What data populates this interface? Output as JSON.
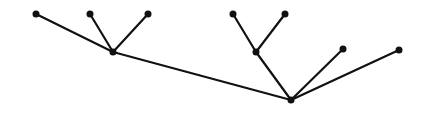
{
  "diagram": {
    "ink_color": "#111111",
    "background_color": "#ffffff",
    "width": 436,
    "height": 122,
    "nodes": [
      {
        "id": "n32",
        "left_label": "a",
        "right_label": "32",
        "x": 36,
        "y": 14
      },
      {
        "id": "n31",
        "left_label": "b",
        "right_label": "31",
        "x": 90,
        "y": 14
      },
      {
        "id": "n3s",
        "left_label": "c",
        "right_label": "3*",
        "x": 148,
        "y": 14
      },
      {
        "id": "n3",
        "left_label": "a→b→c",
        "right_label": "3",
        "x": 113,
        "y": 52
      },
      {
        "id": "n21",
        "left_label": "a",
        "right_label": "21",
        "x": 233,
        "y": 14
      },
      {
        "id": "n2s",
        "left_label": "b",
        "right_label": "2*",
        "x": 285,
        "y": 14
      },
      {
        "id": "n2",
        "left_label": "a→b",
        "right_label": "2",
        "x": 256,
        "y": 52
      },
      {
        "id": "n1",
        "left_label": "a",
        "right_label": "1",
        "x": 343,
        "y": 49
      },
      {
        "id": "nstar",
        "left_label": "c",
        "right_label": "*",
        "x": 399,
        "y": 50
      },
      {
        "id": "root",
        "left_label": "(a→b→c)→ (a→b)→ a→ c",
        "right_label": "∅",
        "x": 291,
        "y": 100
      }
    ],
    "edges": [
      {
        "from": "n32",
        "to": "n3"
      },
      {
        "from": "n31",
        "to": "n3"
      },
      {
        "from": "n3s",
        "to": "n3"
      },
      {
        "from": "n3",
        "to": "root"
      },
      {
        "from": "n21",
        "to": "n2"
      },
      {
        "from": "n2s",
        "to": "n2"
      },
      {
        "from": "n2",
        "to": "root"
      },
      {
        "from": "n1",
        "to": "root"
      },
      {
        "from": "nstar",
        "to": "root"
      }
    ]
  }
}
